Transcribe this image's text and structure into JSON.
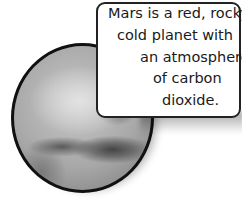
{
  "illustration": {
    "subject": "planet-mars",
    "border_color": "#111111"
  },
  "callout": {
    "lines": [
      "Mars is a red, rocky,",
      "cold planet with",
      "an atmosphere",
      "of carbon",
      "dioxide."
    ],
    "border_color": "#222222",
    "background": "#ffffff"
  }
}
